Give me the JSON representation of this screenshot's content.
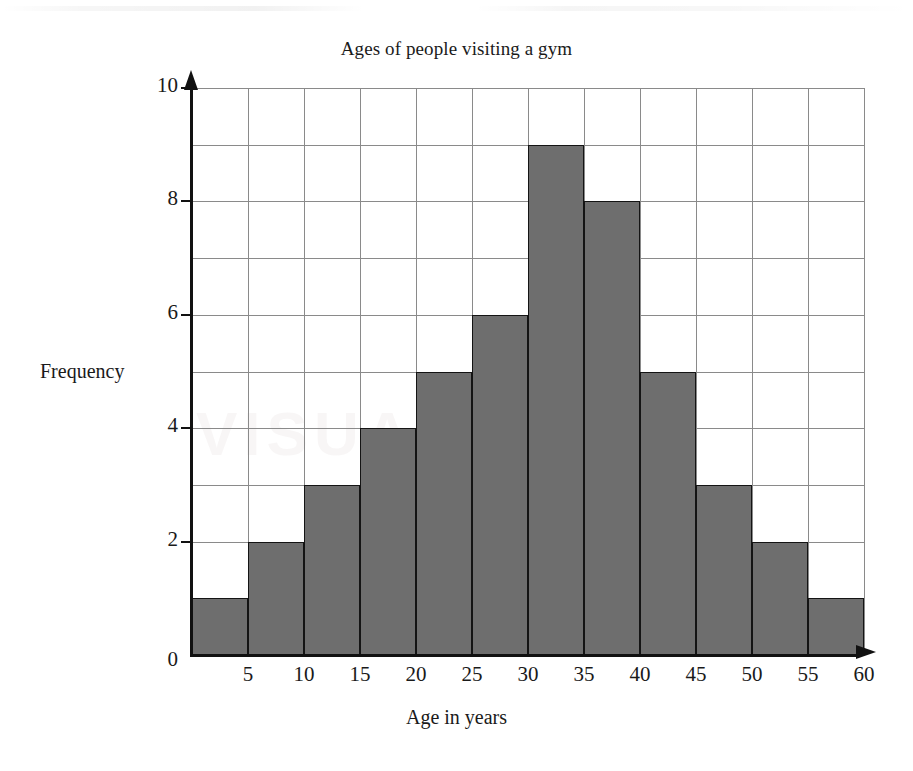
{
  "chart_data": {
    "type": "bar",
    "title": "Ages of people visiting a gym",
    "xlabel": "Age in years",
    "ylabel": "Frequency",
    "categories": [
      "0-5",
      "5-10",
      "10-15",
      "15-20",
      "20-25",
      "25-30",
      "30-35",
      "35-40",
      "40-45",
      "45-50",
      "50-55",
      "55-60"
    ],
    "bin_starts": [
      0,
      5,
      10,
      15,
      20,
      25,
      30,
      35,
      40,
      45,
      50,
      55
    ],
    "bin_width": 5,
    "values": [
      1,
      2,
      3,
      4,
      5,
      6,
      9,
      8,
      5,
      3,
      2,
      1
    ],
    "xlim": [
      0,
      60
    ],
    "ylim": [
      0,
      10
    ],
    "x_ticks": [
      0,
      5,
      10,
      15,
      20,
      25,
      30,
      35,
      40,
      45,
      50,
      55,
      60
    ],
    "x_tick_labels": [
      "0",
      "5",
      "10",
      "15",
      "20",
      "25",
      "30",
      "35",
      "40",
      "45",
      "50",
      "55",
      "60"
    ],
    "y_ticks": [
      0,
      2,
      4,
      6,
      8,
      10
    ],
    "y_tick_labels": [
      "0",
      "2",
      "4",
      "6",
      "8",
      "10"
    ],
    "y_gridline_step": 1,
    "x_gridline_step": 5,
    "grid": true,
    "legend": null,
    "total_frequency": 45,
    "colors": {
      "bar_fill": "#6e6e6e",
      "bar_outline": "#141414",
      "gridline": "#8a8a8a",
      "axis": "#111111",
      "background": "#ffffff",
      "text": "#1a1a1a"
    }
  },
  "watermark": {
    "text": "VISUAL"
  }
}
